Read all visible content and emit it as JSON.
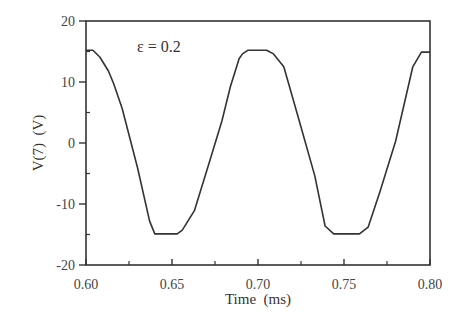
{
  "chart_data": {
    "type": "line",
    "title": "",
    "xlabel": "Time  (ms)",
    "ylabel": "V(7)  (V)",
    "xlim": [
      0.6,
      0.8
    ],
    "ylim": [
      -20,
      20
    ],
    "xticks": [
      0.6,
      0.65,
      0.7,
      0.75,
      0.8
    ],
    "xtick_labels": [
      "0.60",
      "0.65",
      "0.70",
      "0.75",
      "0.80"
    ],
    "x_minor_ticks": [
      0.625,
      0.675,
      0.725,
      0.775
    ],
    "yticks": [
      -20,
      -10,
      0,
      10,
      20
    ],
    "ytick_labels": [
      "-20",
      "-10",
      "0",
      "10",
      "20"
    ],
    "y_minor_ticks": [
      -15,
      -5,
      5,
      15
    ],
    "grid": false,
    "legend": null,
    "annotations": [
      {
        "text": "ε = 0.2",
        "x": 0.63,
        "y": 17.0
      }
    ],
    "series": [
      {
        "name": "V(7)",
        "color": "#333333",
        "x": [
          0.6,
          0.604,
          0.608,
          0.613,
          0.616,
          0.621,
          0.63,
          0.637,
          0.64,
          0.641,
          0.653,
          0.656,
          0.663,
          0.672,
          0.679,
          0.684,
          0.689,
          0.691,
          0.694,
          0.705,
          0.709,
          0.715,
          0.724,
          0.733,
          0.739,
          0.744,
          0.759,
          0.764,
          0.771,
          0.78,
          0.79,
          0.795,
          0.8
        ],
        "y": [
          15.2,
          15.2,
          14.1,
          11.8,
          9.8,
          5.7,
          -4.1,
          -12.8,
          -14.9,
          -14.9,
          -14.9,
          -14.3,
          -11.1,
          -2.9,
          3.6,
          9.3,
          13.8,
          14.6,
          15.2,
          15.2,
          14.6,
          12.5,
          3.6,
          -5.4,
          -13.6,
          -14.9,
          -14.9,
          -13.8,
          -7.9,
          0.3,
          12.5,
          14.9,
          14.9
        ]
      }
    ]
  },
  "annotation_text": "ε = 0.2",
  "x_axis_label": "Time  (ms)",
  "y_axis_label": "V(7)  (V)"
}
